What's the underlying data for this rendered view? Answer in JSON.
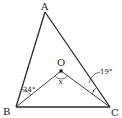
{
  "diagram": {
    "type": "triangle-with-interior-point",
    "points": {
      "A": {
        "label": "A",
        "x": 45,
        "y": 12
      },
      "B": {
        "label": "B",
        "x": 16,
        "y": 107
      },
      "C": {
        "label": "C",
        "x": 110,
        "y": 107
      },
      "O": {
        "label": "O",
        "x": 61,
        "y": 71
      }
    },
    "segments": [
      "AB",
      "AC",
      "BC",
      "BO",
      "OC"
    ],
    "angles": {
      "ABO": {
        "label": "34°",
        "value": 34
      },
      "OCA": {
        "label": "19°",
        "value": 19
      },
      "BOC": {
        "label": "x"
      }
    },
    "colors": {
      "stroke": "#2b2b2b",
      "text": "#222222"
    }
  }
}
